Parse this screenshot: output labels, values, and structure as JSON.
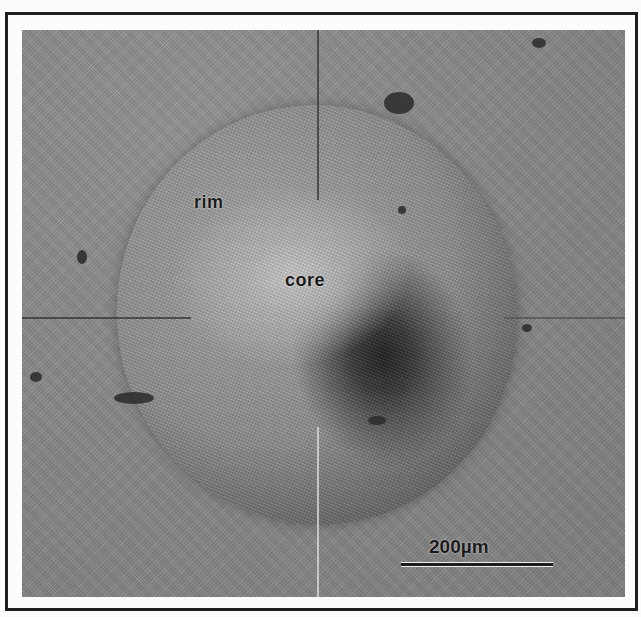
{
  "figure": {
    "labels": {
      "rim": "rim",
      "core": "core"
    },
    "scale_bar": {
      "label": "200µm",
      "value": 200,
      "unit": "µm"
    },
    "colors": {
      "frame_border": "#1e1e1e",
      "background": "#fbfbfb",
      "surface_gray": "#8a8a8a",
      "core_dark": "#1f1f1f",
      "rim_light": "#c9c9c9"
    }
  }
}
